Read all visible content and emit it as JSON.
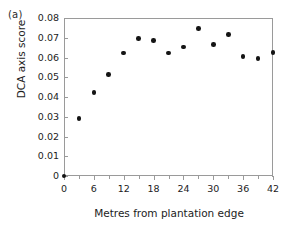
{
  "panel": {
    "label": "(a)"
  },
  "chart_data": {
    "type": "scatter",
    "title": "",
    "xlabel": "Metres from plantation edge",
    "ylabel": "DCA axis score",
    "xlim": [
      0,
      42
    ],
    "ylim": [
      0,
      0.08
    ],
    "grid": false,
    "legend": null,
    "x_ticks": [
      0,
      6,
      12,
      18,
      24,
      30,
      36,
      42
    ],
    "x_tick_labels": [
      "0",
      "6",
      "12",
      "18",
      "24",
      "30",
      "36",
      "42"
    ],
    "x_minor_ticks": [
      3,
      9,
      15,
      21,
      27,
      33,
      39
    ],
    "y_ticks": [
      0,
      0.01,
      0.02,
      0.03,
      0.04,
      0.05,
      0.06,
      0.07,
      0.08
    ],
    "y_tick_labels": [
      "0",
      "0.01",
      "0.02",
      "0.03",
      "0.04",
      "0.05",
      "0.06",
      "0.07",
      "0.08"
    ],
    "marker": "filled-circle",
    "marker_color": "#141414",
    "x": [
      0,
      3,
      6,
      9,
      12,
      15,
      18,
      21,
      24,
      27,
      30,
      33,
      36,
      39,
      42
    ],
    "y": [
      0.0,
      0.0292,
      0.0423,
      0.0514,
      0.0622,
      0.0696,
      0.0687,
      0.0622,
      0.0654,
      0.0747,
      0.0665,
      0.0716,
      0.0606,
      0.0596,
      0.0624
    ],
    "points": [
      {
        "x": 0,
        "y": 0.0
      },
      {
        "x": 3,
        "y": 0.0292
      },
      {
        "x": 6,
        "y": 0.0423
      },
      {
        "x": 9,
        "y": 0.0514
      },
      {
        "x": 12,
        "y": 0.0622
      },
      {
        "x": 15,
        "y": 0.0696
      },
      {
        "x": 18,
        "y": 0.0687
      },
      {
        "x": 21,
        "y": 0.0622
      },
      {
        "x": 24,
        "y": 0.0654
      },
      {
        "x": 27,
        "y": 0.0747
      },
      {
        "x": 30,
        "y": 0.0665
      },
      {
        "x": 33,
        "y": 0.0716
      },
      {
        "x": 36,
        "y": 0.0606
      },
      {
        "x": 39,
        "y": 0.0596
      },
      {
        "x": 42,
        "y": 0.0624
      }
    ]
  },
  "colors": {
    "axis": "#9a9a9a",
    "text": "#1c1c1c",
    "marker": "#141414",
    "background": "#ffffff"
  }
}
